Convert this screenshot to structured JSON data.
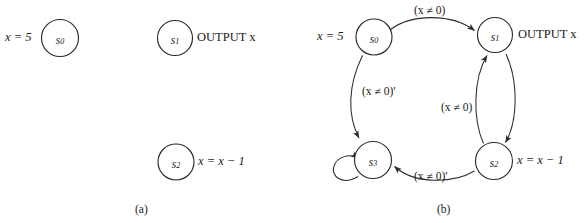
{
  "figure": {
    "background": "#ffffff",
    "ink": "#2b2b2b",
    "panels": [
      {
        "id": "a",
        "caption": "(a)",
        "nodes": [
          {
            "id": "s0",
            "name": "s",
            "sub": "0",
            "side_label": "x = 5",
            "side": "left"
          },
          {
            "id": "s1",
            "name": "s",
            "sub": "1",
            "side_label": "OUTPUT x",
            "side": "right"
          },
          {
            "id": "s2",
            "name": "s",
            "sub": "2",
            "side_label": "x = x − 1",
            "side": "right"
          }
        ],
        "edges": []
      },
      {
        "id": "b",
        "caption": "(b)",
        "nodes": [
          {
            "id": "s0",
            "name": "s",
            "sub": "0",
            "side_label": "x = 5",
            "side": "left"
          },
          {
            "id": "s1",
            "name": "s",
            "sub": "1",
            "side_label": "OUTPUT x",
            "side": "right"
          },
          {
            "id": "s2",
            "name": "s",
            "sub": "2",
            "side_label": "x = x − 1",
            "side": "right"
          },
          {
            "id": "s3",
            "name": "s",
            "sub": "3",
            "side_label": "",
            "side": "none"
          }
        ],
        "edges": [
          {
            "from": "s0",
            "to": "s1",
            "label": "(x ≠ 0)",
            "position": "top"
          },
          {
            "from": "s0",
            "to": "s3",
            "label": "(x ≠ 0)′",
            "position": "left"
          },
          {
            "from": "s2",
            "to": "s1",
            "label": "(x ≠ 0)",
            "position": "middle-right"
          },
          {
            "from": "s1",
            "to": "s2",
            "label": "",
            "position": "right"
          },
          {
            "from": "s2",
            "to": "s3",
            "label": "(x ≠ 0)′",
            "position": "bottom"
          },
          {
            "from": "s3",
            "to": "s3",
            "label": "",
            "position": "self-loop"
          }
        ]
      }
    ]
  },
  "labels": {
    "a_s0_assign": "x = 5",
    "a_s1_output": "OUTPUT x",
    "a_s2_assign": "x = x − 1",
    "a_caption": "(a)",
    "b_s0_assign": "x = 5",
    "b_s1_output": "OUTPUT x",
    "b_s2_assign": "x = x − 1",
    "b_caption": "(b)",
    "b_edge_top": "(x ≠ 0)",
    "b_edge_left": "(x ≠ 0)′",
    "b_edge_middle": "(x ≠ 0)",
    "b_edge_bottom": "(x ≠ 0)′"
  },
  "states": {
    "s0_name": "s",
    "s0_sub": "0",
    "s1_name": "s",
    "s1_sub": "1",
    "s2_name": "s",
    "s2_sub": "2",
    "s3_name": "s",
    "s3_sub": "3"
  }
}
